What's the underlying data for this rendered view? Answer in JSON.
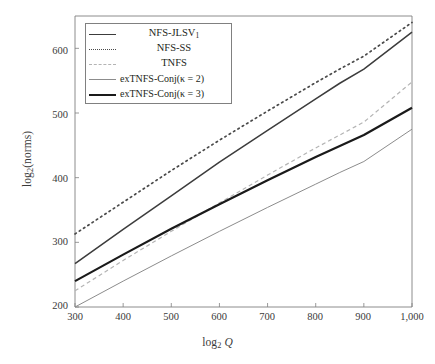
{
  "figure": {
    "background": "#ffffff",
    "frame_color": "#808080"
  },
  "axes": {
    "x_title": "log2 Q",
    "y_title": "log2(norms)",
    "x_ticks": [
      "300",
      "400",
      "500",
      "600",
      "700",
      "800",
      "900",
      "1,000"
    ],
    "y_ticks": [
      "200",
      "300",
      "400",
      "500",
      "600"
    ]
  },
  "legend": {
    "entries": [
      {
        "label": "NFS-JLSV1",
        "style": "solid-med",
        "color": "#3c3c3c"
      },
      {
        "label": "NFS-SS",
        "style": "dotted",
        "color": "#4a4a4a"
      },
      {
        "label": "TNFS",
        "style": "dashed",
        "color": "#b4b4b4"
      },
      {
        "label": "exTNFS-Conj(κ = 2)",
        "style": "thin",
        "color": "#8c8c8c"
      },
      {
        "label": "exTNFS-Conj(κ = 3)",
        "style": "thick",
        "color": "#1a1a1a"
      }
    ]
  },
  "chart_data": {
    "type": "line",
    "title": "",
    "xlabel": "log_2 Q",
    "ylabel": "log_2(norms)",
    "xlim": [
      300,
      1000
    ],
    "ylim": [
      200,
      650
    ],
    "grid": false,
    "legend_position": "upper-left-inside",
    "x": [
      300,
      400,
      500,
      600,
      700,
      800,
      850,
      900,
      1000
    ],
    "series": [
      {
        "name": "NFS-JLSV1",
        "style": "solid-med",
        "color": "#3c3c3c",
        "width": 1.5,
        "values": [
          267,
          320,
          372,
          424,
          473,
          522,
          546,
          568,
          625
        ]
      },
      {
        "name": "NFS-SS",
        "style": "dotted",
        "color": "#4a4a4a",
        "width": 1.7,
        "values": [
          313,
          362,
          411,
          458,
          503,
          547,
          568,
          588,
          640
        ]
      },
      {
        "name": "TNFS",
        "style": "dashed",
        "color": "#b4b4b4",
        "width": 1.2,
        "values": [
          225,
          272,
          317,
          361,
          404,
          446,
          466,
          486,
          548
        ]
      },
      {
        "name": "exTNFS-Conj(κ = 2)",
        "style": "thin",
        "color": "#8c8c8c",
        "width": 1.0,
        "values": [
          200,
          240,
          279,
          317,
          354,
          390,
          408,
          425,
          475
        ]
      },
      {
        "name": "exTNFS-Conj(κ = 3)",
        "style": "thick",
        "color": "#1a1a1a",
        "width": 2.2,
        "values": [
          240,
          281,
          321,
          359,
          396,
          432,
          449,
          466,
          508
        ]
      }
    ]
  }
}
